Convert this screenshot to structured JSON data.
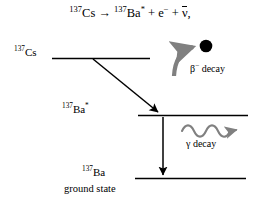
{
  "figure": {
    "background": "#ffffff",
    "width": 260,
    "height": 209
  },
  "equation": {
    "parent_mass": "137",
    "parent_symbol": "Cs",
    "arrow": "→",
    "daughter_mass": "137",
    "daughter_symbol": "Ba",
    "daughter_excited_marker": "*",
    "plus": "+",
    "electron": "e",
    "electron_charge": "−",
    "antineutrino": "ν",
    "trailing_comma": ","
  },
  "levels": [
    {
      "id": "cs-137",
      "mass_number": "137",
      "symbol": "Cs",
      "line_color": "#000000"
    },
    {
      "id": "ba-137-excited",
      "mass_number": "137",
      "symbol": "Ba",
      "excited_marker": "*",
      "line_color": "#000000"
    },
    {
      "id": "ba-137-ground",
      "mass_number": "137",
      "symbol": "Ba",
      "sublabel": "ground state",
      "line_color": "#000000"
    }
  ],
  "transitions": [
    {
      "id": "beta-minus",
      "label_symbol": "β",
      "label_charge": "−",
      "label_text": "decay",
      "arrow_color": "#000000",
      "style": "diagonal-arrow"
    },
    {
      "id": "gamma",
      "label_symbol": "γ",
      "label_text": "decay",
      "arrow_color": "#000000",
      "style": "vertical-arrow"
    }
  ],
  "emissions": [
    {
      "id": "electron-particle",
      "shape": "filled-circle",
      "color": "#000000",
      "curved_arrow_color": "#808080"
    },
    {
      "id": "photon-wave",
      "shape": "wavy-arrow",
      "color": "#808080"
    }
  ],
  "colors": {
    "ink": "#000000",
    "gray_accent": "#808080",
    "background": "#ffffff"
  }
}
